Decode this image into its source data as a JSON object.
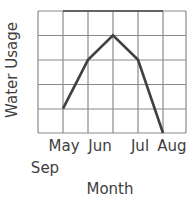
{
  "chart_data": {
    "type": "line",
    "title": "",
    "xlabel": "Month",
    "ylabel": "Water Usage",
    "categories": [
      "May",
      "Jun",
      "Jul",
      "Aug",
      "Sep"
    ],
    "series": [
      {
        "name": "Water Usage",
        "values": [
          1,
          3,
          4,
          3,
          0
        ],
        "color": "#404040"
      }
    ],
    "ylim": [
      0,
      5
    ],
    "grid": true,
    "legend": null,
    "y_tick_labels_shown": false
  }
}
